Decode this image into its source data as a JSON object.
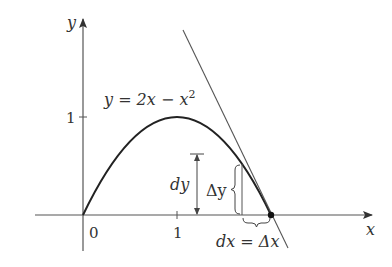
{
  "figure": {
    "title": "",
    "function_label": {
      "prefix": "y = 2x − x",
      "exponent": "2"
    },
    "axes": {
      "x_label": "x",
      "y_label": "y",
      "x_ticks": [
        {
          "value": 0,
          "label": "0"
        },
        {
          "value": 1,
          "label": "1"
        }
      ],
      "y_ticks": [
        {
          "value": 1,
          "label": "1"
        }
      ]
    },
    "annotations": {
      "dy": "dy",
      "delta_y": "Δy",
      "dx_eq_delta_x": "dx = Δx"
    },
    "colors": {
      "curve": "#222222",
      "axes": "#555555",
      "tangent": "#555555",
      "text": "#333333"
    },
    "geometry": {
      "function": "y = 2x - x^2",
      "tangent_point": [
        2,
        0
      ],
      "tangent_slope": -2,
      "x_start_of_increment": 1.69
    }
  }
}
